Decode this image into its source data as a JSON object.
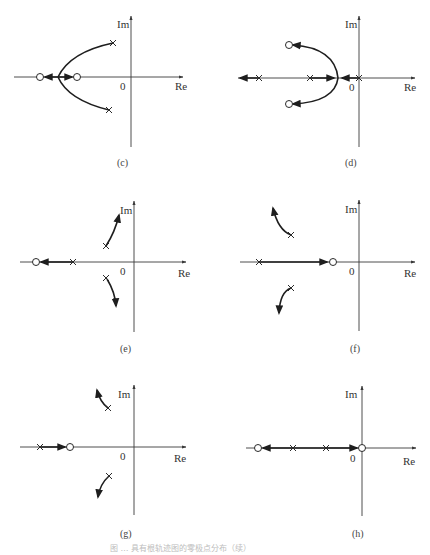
{
  "figure": {
    "caption": "图 … 具有根轨迹图的零极点分布（续）",
    "axis_labels": {
      "real": "Re",
      "imag": "Im",
      "origin": "0"
    }
  },
  "panels": [
    {
      "id": "c",
      "label": "(c)",
      "poles": [
        {
          "re": -0.35,
          "im": 0.65
        },
        {
          "re": -0.4,
          "im": -0.6
        }
      ],
      "zeros": [
        {
          "re": -1.7,
          "im": 0
        },
        {
          "re": -1.0,
          "im": 0
        }
      ],
      "description": "Complex pole pair; loci arc left to real-axis break-in point between two real zeros, then split toward each zero"
    },
    {
      "id": "d",
      "label": "(d)",
      "poles": [
        {
          "re": 0,
          "im": 0
        },
        {
          "re": -1.0,
          "im": 0
        },
        {
          "re": -2.0,
          "im": 0
        }
      ],
      "zeros": [
        {
          "re": -1.4,
          "im": 0.65
        },
        {
          "re": -1.4,
          "im": -0.65
        }
      ],
      "description": "Three real poles; breakaway between 0 and -1, loci curve to complex zero pair; third branch goes to -infinity"
    },
    {
      "id": "e",
      "label": "(e)",
      "poles": [
        {
          "re": -0.55,
          "im": 0.3
        },
        {
          "re": -0.55,
          "im": -0.3
        },
        {
          "re": -1.2,
          "im": 0
        }
      ],
      "zeros": [
        {
          "re": -1.9,
          "im": 0
        }
      ],
      "description": "Complex poles depart toward asymptotes into the right; real pole moves left to zero"
    },
    {
      "id": "f",
      "label": "(f)",
      "poles": [
        {
          "re": -1.35,
          "im": 0.55
        },
        {
          "re": -1.35,
          "im": -0.55
        },
        {
          "re": -2.0,
          "im": 0
        }
      ],
      "zeros": [
        {
          "re": -0.55,
          "im": 0
        }
      ],
      "description": "Complex poles depart outward-left; real pole moves right to zero"
    },
    {
      "id": "g",
      "label": "(g)",
      "poles": [
        {
          "re": -0.5,
          "im": 0.75
        },
        {
          "re": -0.5,
          "im": -0.6
        },
        {
          "re": -1.85,
          "im": 0
        }
      ],
      "zeros": [
        {
          "re": -1.25,
          "im": 0
        }
      ],
      "description": "Complex poles depart upward/downward-left; real pole moves right to zero"
    },
    {
      "id": "h",
      "label": "(h)",
      "poles": [
        {
          "re": -0.7,
          "im": 0
        },
        {
          "re": -1.35,
          "im": 0
        }
      ],
      "zeros": [
        {
          "re": 0,
          "im": 0
        },
        {
          "re": -2.0,
          "im": 0
        }
      ],
      "description": "Two real poles; one branch travels right to zero at origin, the other left to zero at -2"
    }
  ]
}
